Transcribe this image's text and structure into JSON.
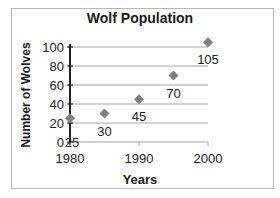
{
  "chart_data": {
    "type": "scatter",
    "title": "Wolf Population",
    "xlabel": "Years",
    "ylabel": "Number of Wolves",
    "x": [
      1980,
      1985,
      1990,
      1995,
      2000
    ],
    "values": [
      25,
      30,
      45,
      70,
      105
    ],
    "data_labels": [
      "25",
      "30",
      "45",
      "70",
      "105"
    ],
    "xticks": [
      "1980",
      "1990",
      "2000"
    ],
    "yticks": [
      "0",
      "20",
      "40",
      "60",
      "80",
      "100"
    ],
    "xlim": [
      1980,
      2000
    ],
    "ylim": [
      0,
      100
    ],
    "grid": "horizontal major gridlines",
    "legend": "none",
    "marker": "diamond",
    "marker_color": "#7f7f7f",
    "gridline_color": "#a6a6a6"
  }
}
